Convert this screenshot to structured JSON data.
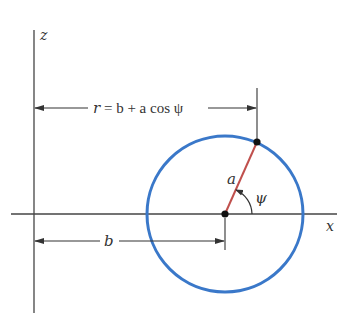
{
  "diagram": {
    "axes": {
      "z_label": "z",
      "x_label": "x"
    },
    "labels": {
      "r_equation_r": "r",
      "r_equation_rest": " = b + a cos ψ",
      "radius": "a",
      "angle": "ψ",
      "offset": "b"
    },
    "colors": {
      "circle": "#3a78c9",
      "radius_line": "#c0504d",
      "lines": "#333333",
      "background": "#ffffff"
    },
    "geometry": {
      "circle_center": [
        225,
        214
      ],
      "circle_radius": 78,
      "point_on_circle": [
        257,
        142
      ],
      "z_axis_x": 34,
      "x_axis_y": 214
    }
  }
}
